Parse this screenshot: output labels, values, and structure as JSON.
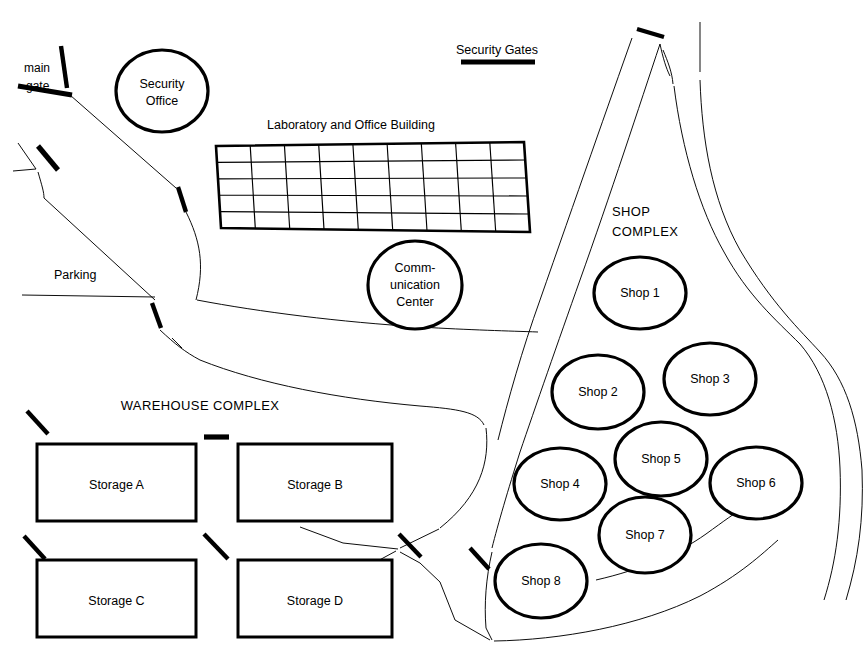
{
  "map": {
    "title": "Facility Site Map",
    "width": 867,
    "height": 668,
    "background_color": "#ffffff",
    "line_color": "#000000"
  },
  "labels": {
    "main_gate": "main\ngate",
    "main_gate_line1": "main",
    "main_gate_line2": "gate",
    "security_gates": "Security Gates",
    "parking": "Parking",
    "laboratory": "Laboratory and Office Building",
    "shop_complex_line1": "SHOP",
    "shop_complex_line2": "COMPLEX",
    "warehouse_complex": "WAREHOUSE COMPLEX"
  },
  "buildings": {
    "security_office": {
      "name": "Security Office",
      "line1": "Security",
      "line2": "Office",
      "shape": "ellipse",
      "cx": 162,
      "cy": 91,
      "rx": 46,
      "ry": 41
    },
    "communication_center": {
      "name": "Communication Center",
      "line1": "Comm-",
      "line2": "unication",
      "line3": "Center",
      "shape": "ellipse",
      "cx": 415,
      "cy": 285,
      "rx": 47,
      "ry": 44
    },
    "laboratory_office": {
      "name": "Laboratory and Office Building",
      "shape": "grid",
      "columns": 9,
      "rows": 5
    }
  },
  "shops": [
    {
      "label": "Shop 1",
      "cx": 640,
      "cy": 293,
      "rx": 46,
      "ry": 36
    },
    {
      "label": "Shop 2",
      "cx": 598,
      "cy": 392,
      "rx": 46,
      "ry": 37
    },
    {
      "label": "Shop 3",
      "cx": 710,
      "cy": 379,
      "rx": 46,
      "ry": 36
    },
    {
      "label": "Shop 4",
      "cx": 560,
      "cy": 484,
      "rx": 46,
      "ry": 36
    },
    {
      "label": "Shop 5",
      "cx": 661,
      "cy": 459,
      "rx": 46,
      "ry": 37
    },
    {
      "label": "Shop 6",
      "cx": 756,
      "cy": 483,
      "rx": 46,
      "ry": 36
    },
    {
      "label": "Shop 7",
      "cx": 645,
      "cy": 535,
      "rx": 46,
      "ry": 38
    },
    {
      "label": "Shop 8",
      "cx": 541,
      "cy": 581,
      "rx": 46,
      "ry": 37
    }
  ],
  "storages": [
    {
      "label": "Storage A",
      "x": 37,
      "y": 444,
      "width": 159,
      "height": 77
    },
    {
      "label": "Storage B",
      "x": 238,
      "y": 444,
      "width": 154,
      "height": 77
    },
    {
      "label": "Storage C",
      "x": 37,
      "y": 560,
      "width": 159,
      "height": 77
    },
    {
      "label": "Storage D",
      "x": 238,
      "y": 560,
      "width": 154,
      "height": 77
    }
  ],
  "gates": [
    {
      "name": "main-gate-bar",
      "x1": 18,
      "y1": 85,
      "x2": 70,
      "y2": 94
    },
    {
      "name": "main-gate-post",
      "x1": 62,
      "y1": 47,
      "x2": 68,
      "y2": 88
    },
    {
      "name": "gate-west-upper",
      "x1": 38,
      "y1": 147,
      "x2": 58,
      "y2": 170
    },
    {
      "name": "gate-lab-west",
      "x1": 178,
      "y1": 187,
      "x2": 185,
      "y2": 211
    },
    {
      "name": "gate-parking-se",
      "x1": 152,
      "y1": 303,
      "x2": 160,
      "y2": 327
    },
    {
      "name": "gate-security-gates",
      "x1": 460,
      "y1": 62,
      "x2": 534,
      "y2": 62
    },
    {
      "name": "gate-north-east",
      "x1": 636,
      "y1": 29,
      "x2": 663,
      "y2": 37
    },
    {
      "name": "gate-warehouse-nw",
      "x1": 28,
      "y1": 411,
      "x2": 48,
      "y2": 433
    },
    {
      "name": "gate-warehouse-n",
      "x1": 203,
      "y1": 437,
      "x2": 228,
      "y2": 437
    },
    {
      "name": "gate-warehouse-w",
      "x1": 24,
      "y1": 536,
      "x2": 44,
      "y2": 558
    },
    {
      "name": "gate-warehouse-c",
      "x1": 204,
      "y1": 534,
      "x2": 227,
      "y2": 558
    },
    {
      "name": "gate-warehouse-e",
      "x1": 398,
      "y1": 534,
      "x2": 420,
      "y2": 556
    },
    {
      "name": "gate-shop-sw",
      "x1": 470,
      "y1": 548,
      "x2": 488,
      "y2": 568
    }
  ]
}
